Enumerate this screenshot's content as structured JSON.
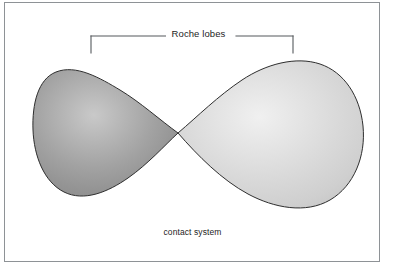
{
  "figure": {
    "top_label": "Roche lobes",
    "caption": "contact system",
    "frame": {
      "border_color": "#8e9296",
      "background": "#ffffff"
    },
    "bracket": {
      "name": "roche-lobes-bracket",
      "color": "#55595d",
      "left_x": 91,
      "right_x": 293,
      "rail_y": 36,
      "tick_bottom_y": 52
    },
    "lobes": [
      {
        "name": "primary-roche-lobe",
        "side": "left",
        "fill": "#9a9a9a",
        "highlight": "#cfcfcf",
        "outline": "#2e2e2e",
        "left_x": 33,
        "right_x": 178,
        "top_y": 66,
        "bottom_y": 198
      },
      {
        "name": "secondary-roche-lobe",
        "side": "right",
        "fill": "#d6d6d6",
        "highlight": "#f2f2f2",
        "outline": "#2e2e2e",
        "left_x": 178,
        "right_x": 363,
        "top_y": 62,
        "bottom_y": 208
      }
    ],
    "contact_point": {
      "name": "inner-lagrangian-point",
      "x": 178,
      "y": 133
    }
  }
}
